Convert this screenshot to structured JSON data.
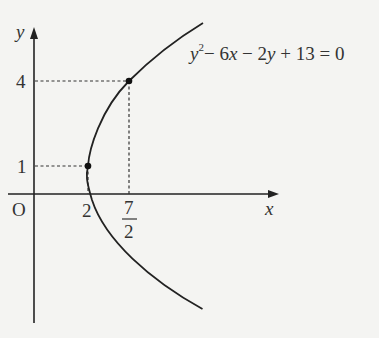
{
  "diagram": {
    "type": "parabola-graph",
    "equation": {
      "y": "y",
      "exp": "2",
      "rest": "− 6x − 2y + 13 = 0",
      "parts": [
        "y",
        "2",
        "− 6",
        "x",
        " − 2",
        "y",
        " + 13 = 0"
      ]
    },
    "axes": {
      "x_label": "x",
      "y_label": "y",
      "origin_label": "O"
    },
    "ticks": {
      "y_4": "4",
      "y_1": "1",
      "x_2": "2",
      "x_frac_num": "7",
      "x_frac_den": "2"
    },
    "points": [
      {
        "x": 2,
        "y": 1,
        "label": "(2, 1)"
      },
      {
        "x": 3.5,
        "y": 4,
        "label": "(7/2, 4)"
      }
    ],
    "colors": {
      "background": "#f4f4f2",
      "ink": "#222222"
    }
  }
}
